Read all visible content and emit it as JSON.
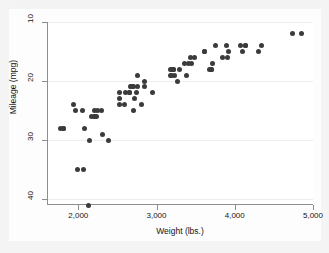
{
  "chart_data": {
    "type": "scatter",
    "title": "",
    "xlabel": "Weight (lbs.)",
    "ylabel": "Mileage (mpg)",
    "xlim": [
      1600,
      5000
    ],
    "ylim": [
      10,
      41
    ],
    "y_axis_reversed": true,
    "grid": true,
    "grid_axis": "y",
    "legend": null,
    "marker_color": "#3b3b3b",
    "marker_size": 5,
    "xticks": [
      2000,
      3000,
      4000,
      5000
    ],
    "xtick_labels": [
      "2,000",
      "3,000",
      "4,000",
      "5,000"
    ],
    "yticks": [
      10,
      20,
      30,
      40
    ],
    "ytick_labels": [
      "10",
      "20",
      "30",
      "40"
    ],
    "x": [
      2930,
      3350,
      2640,
      3250,
      4080,
      3670,
      3690,
      3180,
      3220,
      4060,
      3600,
      3600,
      3740,
      4840,
      4720,
      3830,
      2580,
      3370,
      2730,
      4130,
      4130,
      2830,
      2585,
      3910,
      1800,
      1955,
      3470,
      2070,
      2750,
      2280,
      2750,
      3430,
      3210,
      3200,
      2520,
      2790,
      3420,
      2640,
      2830,
      2200,
      2520,
      2650,
      1980,
      2160,
      2670,
      2370,
      2220,
      2130,
      4330,
      3900,
      4290,
      2690,
      2050,
      3280,
      3880,
      3400,
      2200,
      2520,
      2300,
      2230,
      2690,
      3170,
      2710,
      2200,
      2670,
      3690,
      3180,
      3700,
      2120,
      1800,
      1760,
      2040,
      1930,
      3170
    ],
    "y": [
      22,
      17,
      22,
      20,
      15,
      18,
      18,
      19,
      19,
      14,
      15,
      15,
      14,
      12,
      12,
      16,
      24,
      19,
      22,
      14,
      14,
      20,
      22,
      15,
      28,
      25,
      16,
      28,
      21,
      25,
      19,
      17,
      18,
      18,
      24,
      24,
      16,
      22,
      21,
      25,
      23,
      21,
      35,
      26,
      21,
      30,
      26,
      30,
      14,
      16,
      15,
      21,
      35,
      18,
      14,
      17,
      26,
      22,
      29,
      25,
      25,
      19,
      23,
      26,
      21,
      18,
      18,
      17,
      41,
      28,
      28,
      25,
      24,
      18
    ]
  },
  "accessibility": {
    "plot_type_label": "scatter-plot",
    "point_count": 74
  }
}
